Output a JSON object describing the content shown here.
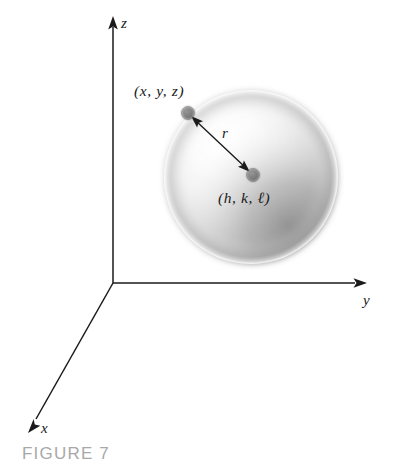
{
  "figure": {
    "caption": "FIGURE 7",
    "caption_color": "#a8a8a8",
    "background_color": "#ffffff",
    "axis_color": "#1a1a1a",
    "dot_color": "#7f7f7f",
    "sphere_shadow_color": "#9a9a9a",
    "axes": {
      "x_label": "x",
      "y_label": "y",
      "z_label": "z"
    },
    "labels": {
      "surface_point": "(x, y, z)",
      "center_point": "(h, k, ℓ)",
      "radius": "r"
    },
    "icons": {
      "x_arrow": "arrowhead-icon",
      "y_arrow": "arrowhead-icon",
      "z_arrow": "arrowhead-icon",
      "radius_arrow": "double-arrow-icon",
      "sphere": "sphere-icon",
      "surface_dot": "point-marker-icon",
      "center_dot": "point-marker-icon"
    },
    "geometry": {
      "origin": "(113, 283)",
      "sphere_center": "(251, 177)",
      "sphere_radius": "86",
      "surface_point_position": "(188, 113)",
      "center_point_position": "(253, 175)"
    }
  }
}
